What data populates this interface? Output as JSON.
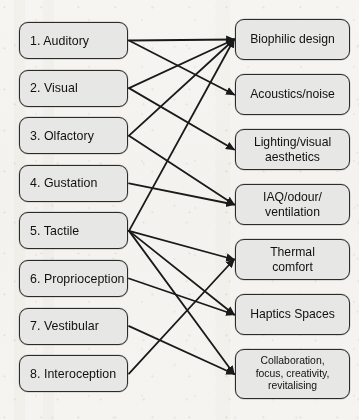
{
  "diagram": {
    "type": "bipartite-mapping-diagram",
    "colors": {
      "node_fill": "#e7e7e5",
      "node_border": "#2b2b2b",
      "line": "#1a1a1a",
      "background": "#f4f3ef",
      "text": "#111111"
    },
    "left_column": {
      "name": "Sensory modalities",
      "nodes": [
        {
          "id": "L1",
          "label": "1. Auditory"
        },
        {
          "id": "L2",
          "label": "2. Visual"
        },
        {
          "id": "L3",
          "label": "3. Olfactory"
        },
        {
          "id": "L4",
          "label": "4. Gustation"
        },
        {
          "id": "L5",
          "label": "5. Tactile"
        },
        {
          "id": "L6",
          "label": "6. Proprioception"
        },
        {
          "id": "L7",
          "label": "7. Vestibular"
        },
        {
          "id": "L8",
          "label": "8. Interoception"
        }
      ]
    },
    "right_column": {
      "name": "Design strategies",
      "nodes": [
        {
          "id": "R1",
          "label": "Biophilic design",
          "small": false
        },
        {
          "id": "R2",
          "label": "Acoustics/noise",
          "small": false
        },
        {
          "id": "R3",
          "label": "Lighting/visual\naesthetics",
          "small": false
        },
        {
          "id": "R4",
          "label": "IAQ/odour/\nventilation",
          "small": false
        },
        {
          "id": "R5",
          "label": "Thermal\ncomfort",
          "small": false
        },
        {
          "id": "R6",
          "label": "Haptics Spaces",
          "small": false
        },
        {
          "id": "R7",
          "label": "Collaboration,\nfocus, creativity,\nrevitalising",
          "small": true
        }
      ]
    },
    "edges": [
      {
        "from": "L1",
        "to": "R1"
      },
      {
        "from": "L1",
        "to": "R2"
      },
      {
        "from": "L2",
        "to": "R1"
      },
      {
        "from": "L2",
        "to": "R3"
      },
      {
        "from": "L3",
        "to": "R1"
      },
      {
        "from": "L3",
        "to": "R4"
      },
      {
        "from": "L4",
        "to": "R4"
      },
      {
        "from": "L5",
        "to": "R1"
      },
      {
        "from": "L5",
        "to": "R5"
      },
      {
        "from": "L5",
        "to": "R6"
      },
      {
        "from": "L5",
        "to": "R7"
      },
      {
        "from": "L6",
        "to": "R6"
      },
      {
        "from": "L7",
        "to": "R7"
      },
      {
        "from": "L8",
        "to": "R5"
      }
    ],
    "geometry": {
      "left": {
        "x": 19,
        "width": 109,
        "first_y": 22,
        "height": 37,
        "pitch": 47.6
      },
      "right": {
        "x": 235,
        "width": 115,
        "first_y": 19,
        "height": 41,
        "pitch": 55.0
      }
    }
  }
}
